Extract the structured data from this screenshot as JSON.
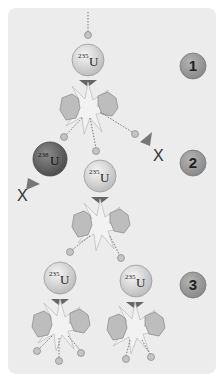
{
  "colors": {
    "panel": "#ececec",
    "u235": "#d2d2d2",
    "u238": "#6a6a6a",
    "badge": "#9a9a9a",
    "fragment": "#b0b0b0",
    "arrow": "#666666",
    "neutron": "#b8b8b8"
  },
  "steps": [
    {
      "label": "1"
    },
    {
      "label": "2"
    },
    {
      "label": "3"
    }
  ],
  "nuclei": [
    {
      "id": "u235-a",
      "mass": "235",
      "symbol": "U",
      "type": "U-235"
    },
    {
      "id": "u238",
      "mass": "238",
      "symbol": "U",
      "type": "U-238"
    },
    {
      "id": "u235-b",
      "mass": "235",
      "symbol": "U",
      "type": "U-235"
    },
    {
      "id": "u235-c",
      "mass": "235",
      "symbol": "U",
      "type": "U-235"
    },
    {
      "id": "u235-d",
      "mass": "235",
      "symbol": "U",
      "type": "U-235"
    }
  ],
  "marks": {
    "blocked": "X"
  }
}
